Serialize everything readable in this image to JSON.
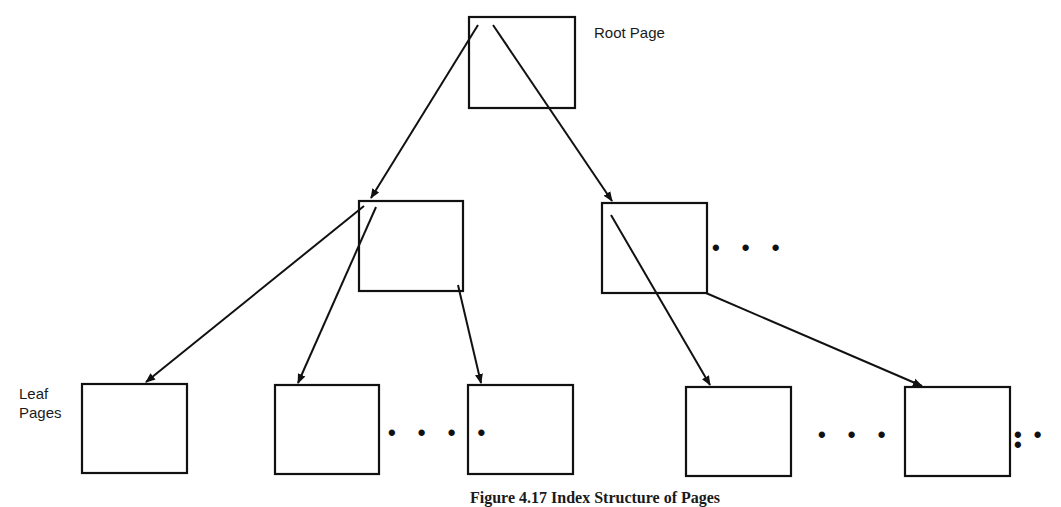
{
  "diagram": {
    "labels": {
      "root": "Root Page",
      "leaf_line1": "Leaf",
      "leaf_line2": "Pages"
    },
    "caption": "Figure 4.17  Index Structure of Pages",
    "ellipses": {
      "mid_right": "• • •",
      "leaf_2_3": "• • • •",
      "leaf_4_5": "• •  •",
      "leaf_end": "• • •"
    },
    "nodes": [
      {
        "id": "root",
        "level": "root",
        "x": 469,
        "y": 17,
        "w": 106,
        "h": 91
      },
      {
        "id": "mid-left",
        "level": "internal",
        "x": 359,
        "y": 201,
        "w": 104,
        "h": 90
      },
      {
        "id": "mid-right",
        "level": "internal",
        "x": 602,
        "y": 203,
        "w": 105,
        "h": 90
      },
      {
        "id": "leaf-1",
        "level": "leaf",
        "x": 82,
        "y": 384,
        "w": 105,
        "h": 89
      },
      {
        "id": "leaf-2",
        "level": "leaf",
        "x": 275,
        "y": 385,
        "w": 104,
        "h": 89
      },
      {
        "id": "leaf-3",
        "level": "leaf",
        "x": 468,
        "y": 385,
        "w": 105,
        "h": 89
      },
      {
        "id": "leaf-4",
        "level": "leaf",
        "x": 686,
        "y": 387,
        "w": 105,
        "h": 89
      },
      {
        "id": "leaf-5",
        "level": "leaf",
        "x": 905,
        "y": 387,
        "w": 105,
        "h": 89
      }
    ],
    "edges": [
      {
        "from": "root",
        "to": "mid-left"
      },
      {
        "from": "root",
        "to": "mid-right"
      },
      {
        "from": "mid-left",
        "to": "leaf-1"
      },
      {
        "from": "mid-left",
        "to": "leaf-2"
      },
      {
        "from": "mid-left",
        "to": "leaf-3"
      },
      {
        "from": "mid-right",
        "to": "leaf-4"
      },
      {
        "from": "mid-right",
        "to": "leaf-5"
      }
    ],
    "stroke_color": "#111111"
  }
}
